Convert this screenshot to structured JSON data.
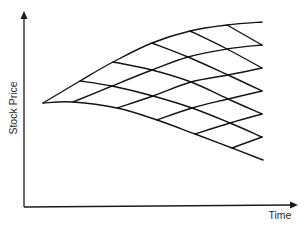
{
  "diagram": {
    "title": "",
    "type": "binomial-lattice",
    "x_axis": {
      "label": "Time"
    },
    "y_axis": {
      "label": "Stock Price"
    },
    "steps": 6,
    "colors": {
      "line": "#141414",
      "axis": "#1a1a1a",
      "background": "#ffffff",
      "text": "#2a2a2a"
    },
    "nodes": [
      [
        [
          43,
          103
        ]
      ],
      [
        [
          80,
          81
        ],
        [
          73,
          102
        ]
      ],
      [
        [
          113,
          62
        ],
        [
          112,
          86
        ],
        [
          117,
          108
        ]
      ],
      [
        [
          152,
          43
        ],
        [
          152,
          70
        ],
        [
          153,
          96
        ],
        [
          157,
          120
        ]
      ],
      [
        [
          190,
          31
        ],
        [
          188,
          57
        ],
        [
          191,
          82
        ],
        [
          192,
          108
        ],
        [
          195,
          134
        ]
      ],
      [
        [
          227,
          25
        ],
        [
          227,
          49
        ],
        [
          228,
          75
        ],
        [
          228,
          99
        ],
        [
          230,
          123
        ],
        [
          232,
          148
        ]
      ],
      [
        [
          262,
          22
        ],
        [
          262,
          45
        ],
        [
          262,
          68
        ],
        [
          262,
          91
        ],
        [
          262,
          114
        ],
        [
          262,
          137
        ],
        [
          263,
          160
        ]
      ]
    ]
  }
}
